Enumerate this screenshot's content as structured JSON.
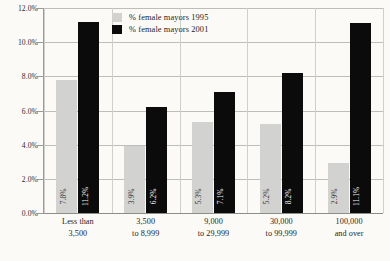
{
  "chart_data": {
    "type": "bar",
    "title": "",
    "subtitle": "",
    "xlabel": "",
    "ylabel": "",
    "ylim": [
      0.0,
      12.0
    ],
    "y_tick_labels": [
      "12.0%",
      "10.0%",
      "8.0%",
      "6.0%",
      "4.0%",
      "2.0%",
      "0.0%"
    ],
    "y_ticks": [
      12.0,
      10.0,
      8.0,
      6.0,
      4.0,
      2.0,
      0.0
    ],
    "grid": "horizontal-and-vertical",
    "legend_position": "top-center",
    "categories": [
      "Less than 3,500",
      "3,500 to 8,999",
      "9,000 to 29,999",
      "30,000 to 99,999",
      "100,000 and over"
    ],
    "category_lines": [
      [
        "Less than",
        "3,500"
      ],
      [
        "3,500",
        "to 8,999"
      ],
      [
        "9,000",
        "to 29,999"
      ],
      [
        "30,000",
        "to 99,999"
      ],
      [
        "100,000",
        "and over"
      ]
    ],
    "series": [
      {
        "name": "% female mayors 1995",
        "color": "#d2d2d0",
        "values": [
          7.8,
          3.9,
          5.3,
          5.2,
          2.9
        ],
        "labels": [
          "7.8%",
          "3.9%",
          "5.3%",
          "5.2%",
          "2.9%"
        ]
      },
      {
        "name": "% female mayors 2001",
        "color": "#0b0b0b",
        "values": [
          11.2,
          6.2,
          7.1,
          8.2,
          11.1
        ],
        "labels": [
          "11.2%",
          "6.2%",
          "7.1%",
          "8.2%",
          "11.1%"
        ]
      }
    ]
  },
  "legend": {
    "items": [
      {
        "label": "% female mayors 1995",
        "swatch": "#d2d2d0"
      },
      {
        "label": "% female mayors 2001",
        "swatch": "#0b0b0b"
      }
    ]
  },
  "colors": {
    "background": "#fbfaf7",
    "gridline": "#bdbdb9",
    "axis": "#9a9a96",
    "series_1995": "#d2d2d0",
    "series_2001": "#0b0b0b"
  }
}
